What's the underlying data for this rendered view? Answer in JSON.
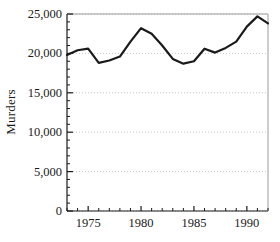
{
  "chart_data": {
    "type": "line",
    "title": "",
    "xlabel": "",
    "ylabel": "Murders",
    "x": [
      1973,
      1974,
      1975,
      1976,
      1977,
      1978,
      1979,
      1980,
      1981,
      1982,
      1983,
      1984,
      1985,
      1986,
      1987,
      1988,
      1989,
      1990,
      1991,
      1992
    ],
    "values": [
      19800,
      20400,
      20600,
      18800,
      19100,
      19600,
      21500,
      23200,
      22500,
      21000,
      19300,
      18700,
      19000,
      20600,
      20100,
      20700,
      21500,
      23400,
      24700,
      23800
    ],
    "series": [
      {
        "name": "Murders",
        "values": [
          19800,
          20400,
          20600,
          18800,
          19100,
          19600,
          21500,
          23200,
          22500,
          21000,
          19300,
          18700,
          19000,
          20600,
          20100,
          20700,
          21500,
          23400,
          24700,
          23800
        ]
      }
    ],
    "xlim": [
      1973,
      1992
    ],
    "ylim": [
      0,
      25000
    ],
    "yticks": [
      0,
      5000,
      10000,
      15000,
      20000,
      25000
    ],
    "ytick_labels": [
      "0",
      "5,000",
      "10,000",
      "15,000",
      "20,000",
      "25,000"
    ],
    "xticks": [
      1975,
      1980,
      1985,
      1990
    ],
    "xtick_labels": [
      "1975",
      "1980",
      "1985",
      "1990"
    ],
    "xminor_ticks": [
      1973,
      1974,
      1975,
      1976,
      1977,
      1978,
      1979,
      1980,
      1981,
      1982,
      1983,
      1984,
      1985,
      1986,
      1987,
      1988,
      1989,
      1990,
      1991,
      1992
    ],
    "grid": "horizontal-dotted",
    "legend": "none",
    "line_color": "#1a1a1a",
    "line_width": 2.2,
    "grid_color": "#c8c8c8",
    "axis_color": "#1a1a1a",
    "background": "#ffffff"
  }
}
